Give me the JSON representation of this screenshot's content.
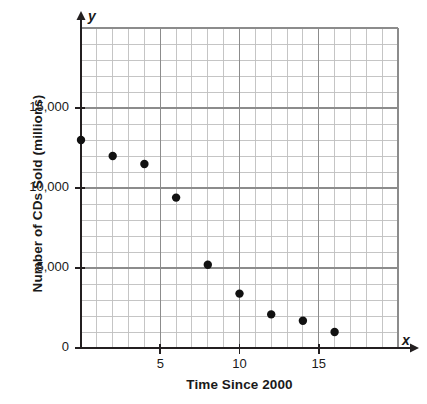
{
  "chart_data": {
    "type": "scatter",
    "title": "",
    "xlabel": "Time Since 2000",
    "ylabel": "Number of CDs Sold (millions)",
    "x_axis_variable": "x",
    "y_axis_variable": "y",
    "xlim": [
      0,
      20
    ],
    "ylim": [
      0,
      20000
    ],
    "x_ticks": [
      5,
      10,
      15
    ],
    "x_tick_labels": [
      "5",
      "10",
      "15"
    ],
    "y_ticks": [
      0,
      5000,
      10000,
      15000
    ],
    "y_tick_labels": [
      "0",
      "5,000",
      "10,000",
      "15,000"
    ],
    "grid": true,
    "grid_x_step": 1,
    "grid_y_step": 1000,
    "legend": "none",
    "marker": "filled-circle",
    "marker_color": "#111111",
    "points": [
      {
        "x": 0,
        "y": 13000
      },
      {
        "x": 2,
        "y": 12000
      },
      {
        "x": 4,
        "y": 11500
      },
      {
        "x": 6,
        "y": 9400
      },
      {
        "x": 8,
        "y": 5200
      },
      {
        "x": 10,
        "y": 3400
      },
      {
        "x": 12,
        "y": 2100
      },
      {
        "x": 14,
        "y": 1700
      },
      {
        "x": 16,
        "y": 1000
      }
    ]
  },
  "colors": {
    "axis": "#231f20",
    "grid_major": "#8c8c8c",
    "grid_minor": "#bfbfbf",
    "marker": "#111111",
    "background": "#ffffff"
  }
}
